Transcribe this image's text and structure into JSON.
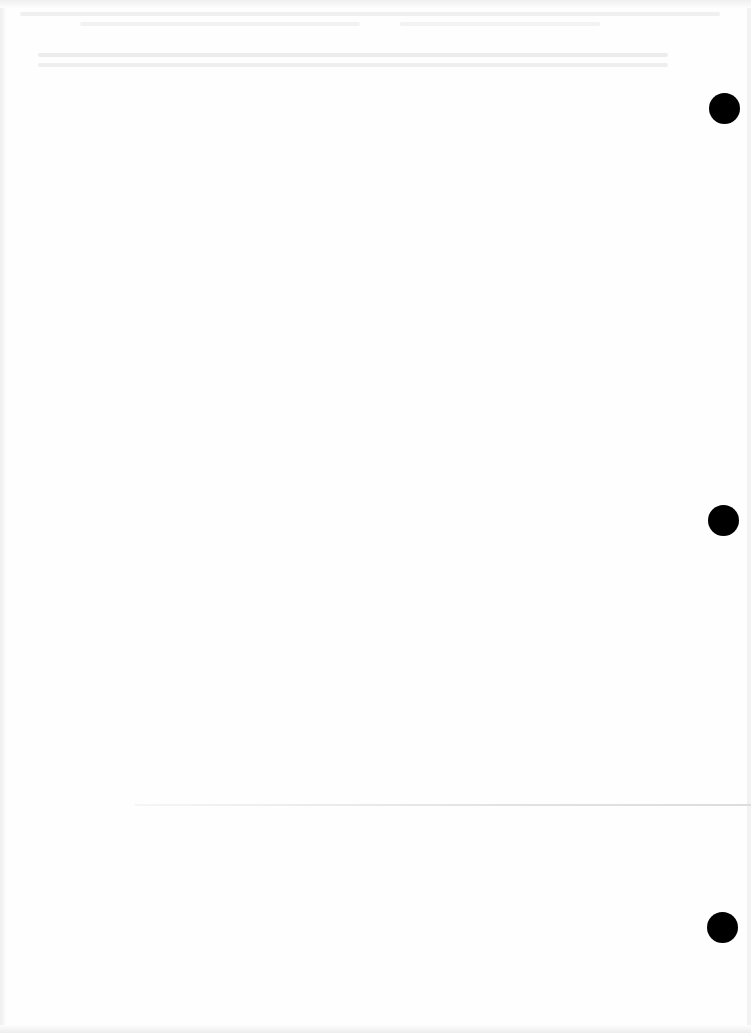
{
  "document": {
    "type": "blank scanned page",
    "background_color": "#fefefe",
    "bleed_through_text": "",
    "binder_holes": [
      {
        "cx": 724,
        "cy": 108,
        "diameter": 31
      },
      {
        "cx": 723,
        "cy": 520,
        "diameter": 31
      },
      {
        "cx": 722,
        "cy": 927,
        "diameter": 31
      }
    ],
    "hole_color": "#000000"
  }
}
